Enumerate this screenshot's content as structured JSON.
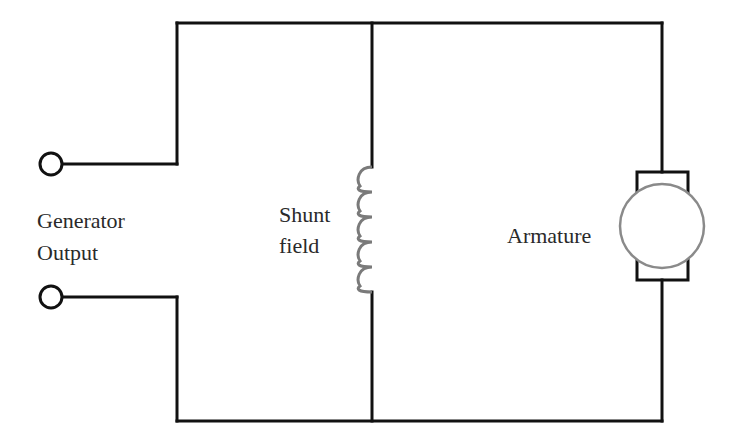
{
  "diagram": {
    "type": "circuit",
    "colors": {
      "wire": "#111111",
      "coil": "#7a7a7a",
      "armature": "#8a8a8a",
      "text": "#2a2a2a",
      "background": "#ffffff"
    },
    "labels": {
      "generator_output_line1": "Generator",
      "generator_output_line2": "Output",
      "shunt_field_line1": "Shunt",
      "shunt_field_line2": "field",
      "armature": "Armature"
    },
    "components": [
      {
        "id": "terminal-positive",
        "kind": "terminal"
      },
      {
        "id": "terminal-negative",
        "kind": "terminal"
      },
      {
        "id": "shunt-field-coil",
        "kind": "inductor",
        "turns": 5
      },
      {
        "id": "armature",
        "kind": "dc-machine-armature"
      }
    ]
  }
}
